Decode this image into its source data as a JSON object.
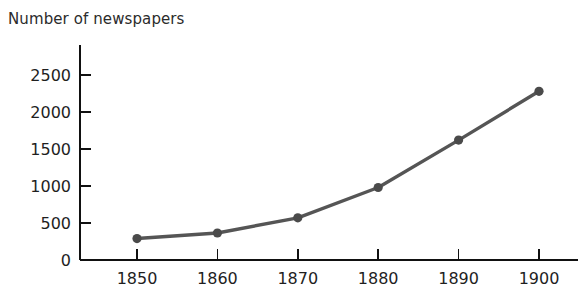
{
  "chart_data": {
    "type": "line",
    "title": "Number of newspapers",
    "xlabel": "",
    "ylabel": "",
    "x": [
      1850,
      1860,
      1870,
      1880,
      1890,
      1900
    ],
    "categories": [
      "1850",
      "1860",
      "1870",
      "1880",
      "1890",
      "1900"
    ],
    "values": [
      290,
      365,
      570,
      980,
      1620,
      2280
    ],
    "series": [
      {
        "name": "Number of newspapers",
        "values": [
          290,
          365,
          570,
          980,
          1620,
          2280
        ]
      }
    ],
    "xlim": [
      1845,
      1905
    ],
    "ylim": [
      0,
      2500
    ],
    "ytick_labels": [
      "0",
      "500",
      "1000",
      "1500",
      "2000",
      "2500"
    ],
    "ytick_values": [
      0,
      500,
      1000,
      1500,
      2000,
      2500
    ],
    "xtick_labels": [
      "1850",
      "1860",
      "1870",
      "1880",
      "1890",
      "1900"
    ],
    "xtick_values": [
      1850,
      1860,
      1870,
      1880,
      1890,
      1900
    ],
    "grid": false,
    "legend": null,
    "line_color": "#555555",
    "marker_color": "#4a4a4a",
    "axis_color": "#111111"
  },
  "geometry": {
    "axis_x": 80,
    "axis_y_bottom": 260,
    "axis_y_top": 45,
    "axis_x_right": 578,
    "x_positions": [
      137,
      216,
      297,
      378,
      457,
      539
    ],
    "y_positions": [
      260,
      223,
      186,
      149,
      112,
      75
    ],
    "point_y": [
      241,
      233,
      218,
      185,
      132,
      80
    ]
  }
}
